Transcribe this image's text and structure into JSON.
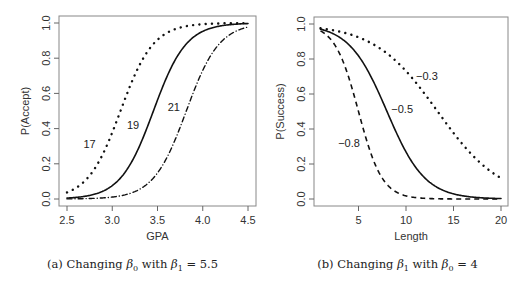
{
  "chart_data": [
    {
      "type": "line",
      "title": "",
      "caption": "(a) Changing β0 with β1 = 5.5",
      "caption_parts": {
        "prefix": "(a) Changing ",
        "param": "β",
        "param_sub": "0",
        "middle": " with ",
        "fixed": "β",
        "fixed_sub": "1",
        "suffix": " = 5.5"
      },
      "xlabel": "GPA",
      "ylabel": "P(Accept)",
      "xlim": [
        2.5,
        4.5
      ],
      "ylim": [
        0.0,
        1.0
      ],
      "xticks": [
        "2.5",
        "3.0",
        "3.5",
        "4.0",
        "4.5"
      ],
      "yticks": [
        "0.0",
        "0.2",
        "0.4",
        "0.6",
        "0.8",
        "1.0"
      ],
      "grid": false,
      "model": "logistic: P = 1/(1+exp(-(b0 + 5.5*x)))",
      "series": [
        {
          "name": "17",
          "beta0": -17,
          "beta1": 5.5,
          "style": "dotted",
          "label_pos": [
            2.75,
            0.29
          ]
        },
        {
          "name": "19",
          "beta0": -19,
          "beta1": 5.5,
          "style": "solid",
          "label_pos": [
            3.23,
            0.4
          ]
        },
        {
          "name": "21",
          "beta0": -21,
          "beta1": 5.5,
          "style": "dashdot",
          "label_pos": [
            3.68,
            0.5
          ]
        }
      ],
      "x": [
        2.5,
        2.75,
        3.0,
        3.25,
        3.5,
        3.75,
        4.0,
        4.25,
        4.5
      ],
      "values": {
        "17": [
          0.047,
          0.165,
          0.438,
          0.75,
          0.915,
          0.974,
          0.992,
          0.998,
          0.999
        ],
        "19": [
          0.006,
          0.025,
          0.095,
          0.289,
          0.568,
          0.834,
          0.953,
          0.988,
          0.997
        ],
        "21": [
          0.001,
          0.004,
          0.014,
          0.054,
          0.182,
          0.438,
          0.75,
          0.915,
          0.974
        ]
      }
    },
    {
      "type": "line",
      "title": "",
      "caption": "(b) Changing β1 with β0 = 4",
      "caption_parts": {
        "prefix": "(b) Changing ",
        "param": "β",
        "param_sub": "1",
        "middle": " with ",
        "fixed": "β",
        "fixed_sub": "0",
        "suffix": " = 4"
      },
      "xlabel": "Length",
      "ylabel": "P(Success)",
      "xlim": [
        1,
        20
      ],
      "ylim": [
        0.0,
        1.0
      ],
      "xticks": [
        "5",
        "10",
        "15",
        "20"
      ],
      "yticks": [
        "0.0",
        "0.2",
        "0.4",
        "0.6",
        "0.8",
        "1.0"
      ],
      "grid": false,
      "model": "logistic: P = 1/(1+exp(-(4 + b1*x)))",
      "series": [
        {
          "name": "-0.3",
          "beta0": 4,
          "beta1": -0.3,
          "style": "dotted",
          "label_pos": [
            12.2,
            0.68
          ]
        },
        {
          "name": "-0.5",
          "beta0": 4,
          "beta1": -0.5,
          "style": "solid",
          "label_pos": [
            9.6,
            0.49
          ]
        },
        {
          "name": "-0.8",
          "beta0": 4,
          "beta1": -0.8,
          "style": "dashed",
          "label_pos": [
            4.0,
            0.3
          ]
        }
      ],
      "x": [
        1,
        5,
        10,
        15,
        20
      ],
      "values": {
        "-0.3": [
          0.978,
          0.924,
          0.731,
          0.378,
          0.119
        ],
        "-0.5": [
          0.971,
          0.818,
          0.269,
          0.029,
          0.002
        ],
        "-0.8": [
          0.961,
          0.5,
          0.018,
          0.0003,
          0.0
        ]
      }
    }
  ]
}
